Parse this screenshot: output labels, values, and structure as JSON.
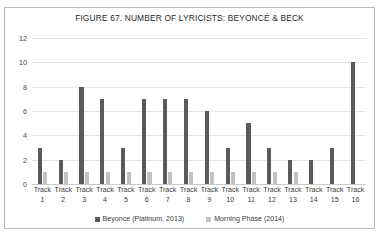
{
  "figure": {
    "title": "FIGURE 67. NUMBER OF LYRICISTS: BEYONCÉ & BECK",
    "border_color": "#b9b9b9"
  },
  "legend": {
    "position": "bottom-center",
    "entries": [
      {
        "label": "Beyonce (Platinum, 2013)",
        "color": "#5a5a5a",
        "marker": "square-swatch"
      },
      {
        "label": "Morning Phase (2014)",
        "color": "#c2c2c2",
        "marker": "square-swatch"
      }
    ]
  },
  "axes": {
    "y_ticks": [
      "0",
      "2",
      "4",
      "6",
      "8",
      "10",
      "12"
    ],
    "x_label_prefix": "Track",
    "x_label_numbers": [
      "1",
      "2",
      "3",
      "4",
      "5",
      "6",
      "7",
      "8",
      "9",
      "10",
      "11",
      "12",
      "13",
      "14",
      "15",
      "16"
    ]
  },
  "chart_data": {
    "type": "bar",
    "title": "FIGURE 67. NUMBER OF LYRICISTS: BEYONCÉ & BECK",
    "xlabel": "",
    "ylabel": "",
    "ylim": [
      0,
      12
    ],
    "yticks": [
      0,
      2,
      4,
      6,
      8,
      10,
      12
    ],
    "grid": true,
    "legend_position": "bottom",
    "categories": [
      "Track 1",
      "Track 2",
      "Track 3",
      "Track 4",
      "Track 5",
      "Track 6",
      "Track 7",
      "Track 8",
      "Track 9",
      "Track 10",
      "Track 11",
      "Track 12",
      "Track 13",
      "Track 14",
      "Track 15",
      "Track 16"
    ],
    "series": [
      {
        "name": "Beyonce (Platinum, 2013)",
        "color": "#5a5a5a",
        "values": [
          3,
          2,
          8,
          7,
          3,
          7,
          7,
          7,
          6,
          3,
          5,
          3,
          2,
          2,
          3,
          10
        ]
      },
      {
        "name": "Morning Phase (2014)",
        "color": "#c2c2c2",
        "values": [
          1,
          1,
          1,
          1,
          1,
          1,
          1,
          1,
          1,
          1,
          1,
          1,
          1,
          0,
          0,
          0
        ]
      }
    ]
  }
}
